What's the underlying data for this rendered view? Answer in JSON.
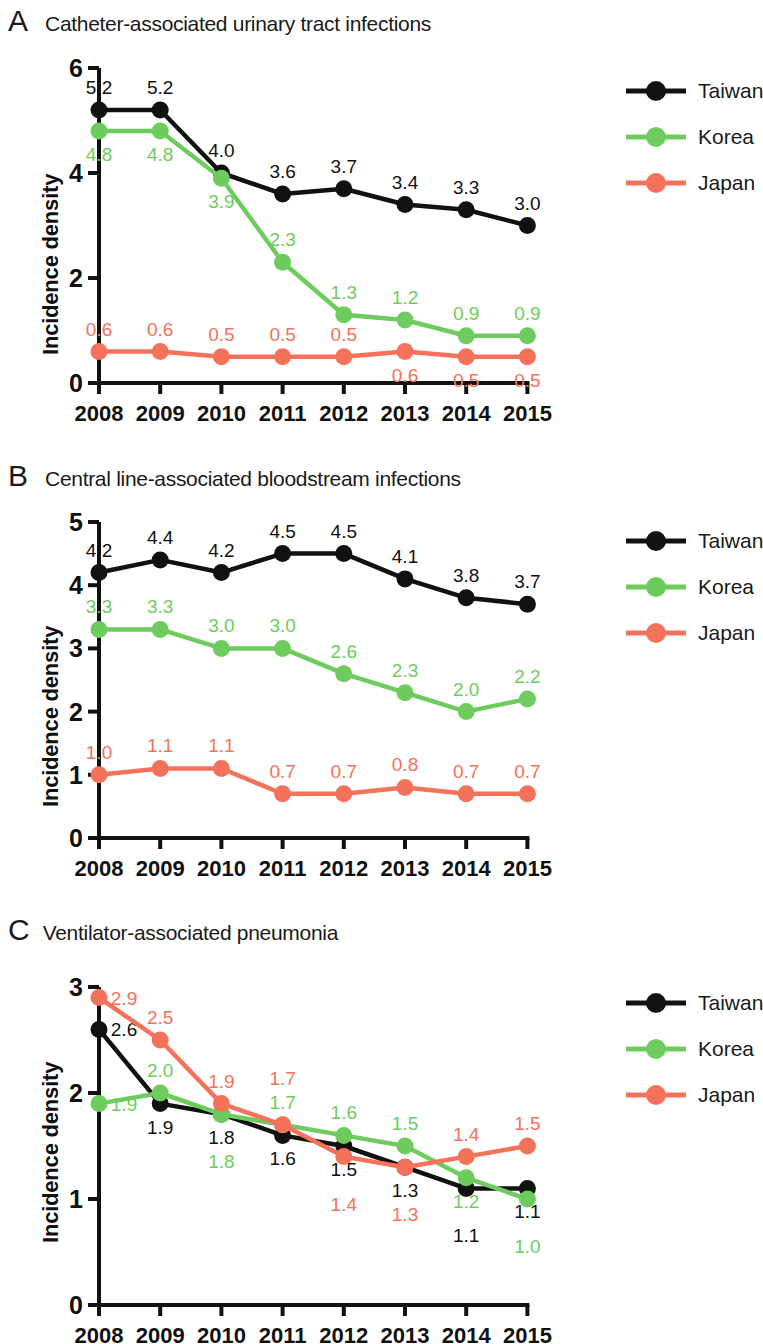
{
  "figure": {
    "ylabel": "Incidence density",
    "years": [
      "2008",
      "2009",
      "2010",
      "2011",
      "2012",
      "2013",
      "2014",
      "2015"
    ],
    "legend": [
      {
        "name": "Taiwan",
        "color": "#111111"
      },
      {
        "name": "Korea",
        "color": "#6ECC5E"
      },
      {
        "name": "Japan",
        "color": "#F5725A"
      }
    ]
  },
  "panels": [
    {
      "letter": "A",
      "title": "Catheter-associated urinary tract infections"
    },
    {
      "letter": "B",
      "title": "Central line-associated bloodstream infections"
    },
    {
      "letter": "C",
      "title": "Ventilator-associated pneumonia"
    }
  ],
  "chart_data": [
    {
      "type": "line",
      "panel": "A",
      "title": "Catheter-associated urinary tract infections",
      "xlabel": "",
      "ylabel": "Incidence density",
      "x": [
        "2008",
        "2009",
        "2010",
        "2011",
        "2012",
        "2013",
        "2014",
        "2015"
      ],
      "yticks": [
        0,
        2,
        4,
        6
      ],
      "ylim": [
        0,
        6
      ],
      "grid": false,
      "legend_position": "right",
      "series": [
        {
          "name": "Taiwan",
          "color": "#111111",
          "values": [
            5.2,
            5.2,
            4.0,
            3.6,
            3.7,
            3.4,
            3.3,
            3.0
          ],
          "labels": [
            "5.2",
            "5.2",
            "4.0",
            "3.6",
            "3.7",
            "3.4",
            "3.3",
            "3.0"
          ],
          "label_side": [
            "above",
            "above",
            "above",
            "above",
            "above",
            "above",
            "above",
            "above"
          ]
        },
        {
          "name": "Korea",
          "color": "#6ECC5E",
          "values": [
            4.8,
            4.8,
            3.9,
            2.3,
            1.3,
            1.2,
            0.9,
            0.9
          ],
          "labels": [
            "4.8",
            "4.8",
            "3.9",
            "2.3",
            "1.3",
            "1.2",
            "0.9",
            "0.9"
          ],
          "label_side": [
            "below",
            "below",
            "below",
            "above",
            "above",
            "above",
            "above",
            "above"
          ]
        },
        {
          "name": "Japan",
          "color": "#F5725A",
          "values": [
            0.6,
            0.6,
            0.5,
            0.5,
            0.5,
            0.6,
            0.5,
            0.5
          ],
          "labels": [
            "0.6",
            "0.6",
            "0.5",
            "0.5",
            "0.5",
            "0.6",
            "0.5",
            "0.5"
          ],
          "label_side": [
            "above",
            "above",
            "above",
            "above",
            "above",
            "below",
            "below",
            "below"
          ]
        }
      ]
    },
    {
      "type": "line",
      "panel": "B",
      "title": "Central line-associated bloodstream infections",
      "xlabel": "",
      "ylabel": "Incidence density",
      "x": [
        "2008",
        "2009",
        "2010",
        "2011",
        "2012",
        "2013",
        "2014",
        "2015"
      ],
      "yticks": [
        0,
        1,
        2,
        3,
        4,
        5
      ],
      "ylim": [
        0,
        5
      ],
      "grid": false,
      "legend_position": "right",
      "series": [
        {
          "name": "Taiwan",
          "color": "#111111",
          "values": [
            4.2,
            4.4,
            4.2,
            4.5,
            4.5,
            4.1,
            3.8,
            3.7
          ],
          "labels": [
            "4.2",
            "4.4",
            "4.2",
            "4.5",
            "4.5",
            "4.1",
            "3.8",
            "3.7"
          ],
          "label_side": [
            "above",
            "above",
            "above",
            "above",
            "above",
            "above",
            "above",
            "above"
          ]
        },
        {
          "name": "Korea",
          "color": "#6ECC5E",
          "values": [
            3.3,
            3.3,
            3.0,
            3.0,
            2.6,
            2.3,
            2.0,
            2.2
          ],
          "labels": [
            "3.3",
            "3.3",
            "3.0",
            "3.0",
            "2.6",
            "2.3",
            "2.0",
            "2.2"
          ],
          "label_side": [
            "above",
            "above",
            "above",
            "above",
            "above",
            "above",
            "above",
            "above"
          ]
        },
        {
          "name": "Japan",
          "color": "#F5725A",
          "values": [
            1.0,
            1.1,
            1.1,
            0.7,
            0.7,
            0.8,
            0.7,
            0.7
          ],
          "labels": [
            "1.0",
            "1.1",
            "1.1",
            "0.7",
            "0.7",
            "0.8",
            "0.7",
            "0.7"
          ],
          "label_side": [
            "above",
            "above",
            "above",
            "above",
            "above",
            "above",
            "above",
            "above"
          ]
        }
      ]
    },
    {
      "type": "line",
      "panel": "C",
      "title": "Ventilator-associated pneumonia",
      "xlabel": "",
      "ylabel": "Incidence density",
      "x": [
        "2008",
        "2009",
        "2010",
        "2011",
        "2012",
        "2013",
        "2014",
        "2015"
      ],
      "yticks": [
        0,
        1,
        2,
        3
      ],
      "ylim": [
        0,
        3
      ],
      "grid": false,
      "legend_position": "right",
      "series": [
        {
          "name": "Taiwan",
          "color": "#111111",
          "values": [
            2.6,
            1.9,
            1.8,
            1.6,
            1.5,
            1.3,
            1.1,
            1.1
          ],
          "labels": [
            "2.6",
            "1.9",
            "1.8",
            "1.6",
            "1.5",
            "1.3",
            "1.1",
            "1.1"
          ],
          "label_side": [
            "right",
            "below",
            "below",
            "below",
            "below",
            "below",
            "below2",
            "below"
          ]
        },
        {
          "name": "Korea",
          "color": "#6ECC5E",
          "values": [
            1.9,
            2.0,
            1.8,
            1.7,
            1.6,
            1.5,
            1.2,
            1.0
          ],
          "labels": [
            "1.9",
            "2.0",
            "1.8",
            "1.7",
            "1.6",
            "1.5",
            "1.2",
            "1.0"
          ],
          "label_side": [
            "right",
            "above",
            "below2",
            "above",
            "above",
            "above",
            "below",
            "below2"
          ]
        },
        {
          "name": "Japan",
          "color": "#F5725A",
          "values": [
            2.9,
            2.5,
            1.9,
            1.7,
            1.4,
            1.3,
            1.4,
            1.5
          ],
          "labels": [
            "2.9",
            "2.5",
            "1.9",
            "1.7",
            "1.4",
            "1.3",
            "1.4",
            "1.5"
          ],
          "label_side": [
            "right",
            "above",
            "above",
            "above2",
            "below2",
            "below2",
            "above",
            "above"
          ]
        }
      ]
    }
  ]
}
